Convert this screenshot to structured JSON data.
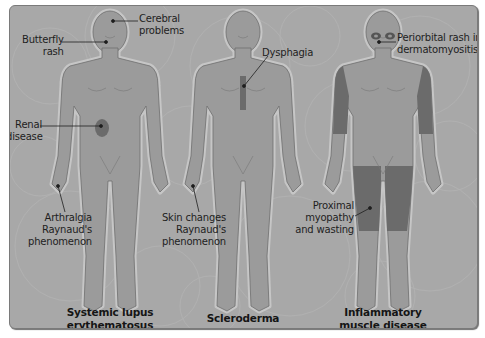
{
  "diagram": {
    "colors": {
      "panel_background": "#a9a9a9",
      "body_fill": "#9a9a9a",
      "body_outline": "#6e6e6e",
      "body_halo": "#c4c4c4",
      "affected_area": "#6b6b6b",
      "text": "#1e1e1e"
    },
    "figures": [
      {
        "id": "sle",
        "caption": "Systemic lupus\nerythematosus",
        "labels": [
          {
            "id": "butterfly-rash",
            "text": "Butterfly\nrash"
          },
          {
            "id": "cerebral-problems",
            "text": "Cerebral\nproblems"
          },
          {
            "id": "renal-disease",
            "text": "Renal\ndisease"
          },
          {
            "id": "arthralgia",
            "text": "Arthralgia\nRaynaud's\nphenomenon"
          }
        ]
      },
      {
        "id": "scleroderma",
        "caption": "Scleroderma",
        "labels": [
          {
            "id": "dysphagia",
            "text": "Dysphagia"
          },
          {
            "id": "skin-changes",
            "text": "Skin changes\nRaynaud's\nphenomenon"
          }
        ]
      },
      {
        "id": "inflammatory-muscle",
        "caption": "Inflammatory\nmuscle disease",
        "labels": [
          {
            "id": "periorbital-rash",
            "text": "Periorbital rash in\ndermatomyositis"
          },
          {
            "id": "proximal-myopathy",
            "text": "Proximal\nmyopathy\nand wasting"
          }
        ]
      }
    ]
  }
}
